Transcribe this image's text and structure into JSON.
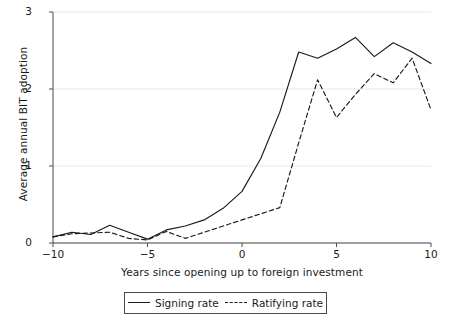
{
  "chart_data": {
    "type": "line",
    "title": "",
    "xlabel": "Years since opening up to foreign investment",
    "ylabel": "Average annual BIT adoption",
    "xlim": [
      -10,
      10
    ],
    "ylim": [
      0,
      3
    ],
    "xticks": [
      "-10",
      "-5",
      "0",
      "5",
      "10"
    ],
    "xtick_values": [
      -10,
      -5,
      0,
      5,
      10
    ],
    "yticks": [
      "0",
      "1",
      "2",
      "3"
    ],
    "ytick_values": [
      0,
      1,
      2,
      3
    ],
    "grid": "horizontal",
    "legend_position": "below-axes",
    "x": [
      -10,
      -9,
      -8,
      -7,
      -6,
      -5,
      -4,
      -3,
      -2,
      -1,
      0,
      1,
      2,
      3,
      4,
      5,
      6,
      7,
      8,
      9,
      10
    ],
    "series": [
      {
        "name": "Signing rate",
        "style": "solid",
        "color": "#1a1a1a",
        "values": [
          0.08,
          0.14,
          0.11,
          0.23,
          0.14,
          0.05,
          0.17,
          0.22,
          0.3,
          0.45,
          0.67,
          1.1,
          1.7,
          2.48,
          2.4,
          2.52,
          2.67,
          2.42,
          2.6,
          2.48,
          2.33
        ]
      },
      {
        "name": "Ratifying rate",
        "style": "dashed",
        "color": "#1a1a1a",
        "values": [
          0.08,
          0.12,
          0.13,
          0.14,
          0.06,
          0.04,
          0.15,
          0.06,
          0.14,
          0.22,
          0.3,
          0.38,
          0.46,
          1.3,
          2.12,
          1.63,
          1.93,
          2.2,
          2.08,
          2.4,
          1.73
        ]
      }
    ]
  },
  "axes": {
    "ylabel": "Average annual BIT adoption",
    "xlabel": "Years since opening up to foreign investment"
  },
  "legend": {
    "items": [
      {
        "label": "Signing rate",
        "style": "solid"
      },
      {
        "label": "Ratifying rate",
        "style": "dashed"
      }
    ]
  },
  "colors": {
    "line": "#1a1a1a",
    "grid": "#e8e8e8",
    "axis": "#4a4a4a",
    "background": "#ffffff"
  }
}
